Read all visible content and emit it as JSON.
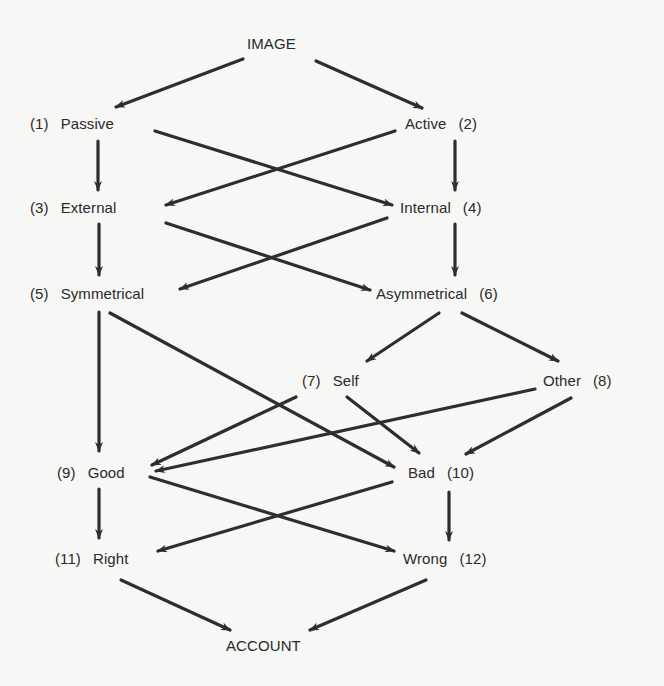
{
  "diagram": {
    "type": "flow-diagram",
    "line_color": "#2e2e2e",
    "background": "#f7f7f5",
    "nodes": {
      "image": {
        "label": "IMAGE",
        "number": ""
      },
      "passive": {
        "label": "Passive",
        "number": "(1)"
      },
      "active": {
        "label": "Active",
        "number": "(2)"
      },
      "external": {
        "label": "External",
        "number": "(3)"
      },
      "internal": {
        "label": "Internal",
        "number": "(4)"
      },
      "symmetrical": {
        "label": "Symmetrical",
        "number": "(5)"
      },
      "asymmetrical": {
        "label": "Asymmetrical",
        "number": "(6)"
      },
      "self": {
        "label": "Self",
        "number": "(7)"
      },
      "other": {
        "label": "Other",
        "number": "(8)"
      },
      "good": {
        "label": "Good",
        "number": "(9)"
      },
      "bad": {
        "label": "Bad",
        "number": "(10)"
      },
      "right": {
        "label": "Right",
        "number": "(11)"
      },
      "wrong": {
        "label": "Wrong",
        "number": "(12)"
      },
      "account": {
        "label": "ACCOUNT",
        "number": ""
      }
    },
    "edges": [
      [
        "IMAGE",
        "Passive"
      ],
      [
        "IMAGE",
        "Active"
      ],
      [
        "Passive",
        "External"
      ],
      [
        "Passive",
        "Internal"
      ],
      [
        "Active",
        "External"
      ],
      [
        "Active",
        "Internal"
      ],
      [
        "External",
        "Symmetrical"
      ],
      [
        "External",
        "Asymmetrical"
      ],
      [
        "Internal",
        "Symmetrical"
      ],
      [
        "Internal",
        "Asymmetrical"
      ],
      [
        "Symmetrical",
        "Good"
      ],
      [
        "Symmetrical",
        "Bad"
      ],
      [
        "Asymmetrical",
        "Self"
      ],
      [
        "Asymmetrical",
        "Other"
      ],
      [
        "Self",
        "Good"
      ],
      [
        "Self",
        "Bad"
      ],
      [
        "Other",
        "Good"
      ],
      [
        "Other",
        "Bad"
      ],
      [
        "Good",
        "Right"
      ],
      [
        "Good",
        "Wrong"
      ],
      [
        "Bad",
        "Right"
      ],
      [
        "Bad",
        "Wrong"
      ],
      [
        "Right",
        "ACCOUNT"
      ],
      [
        "Wrong",
        "ACCOUNT"
      ]
    ]
  }
}
